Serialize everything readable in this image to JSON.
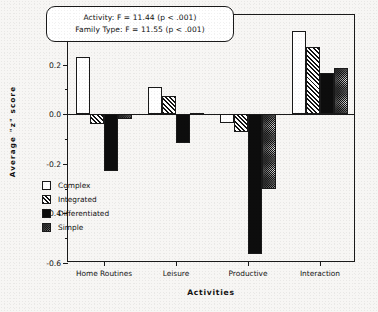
{
  "chart_data": {
    "type": "bar",
    "title": "",
    "xlabel": "Activities",
    "ylabel": "Average \"z\" score",
    "categories": [
      "Home Routines",
      "Leisure",
      "Productive",
      "Interaction"
    ],
    "series": [
      {
        "name": "Complex",
        "pattern": "open-white",
        "values": [
          0.23,
          0.11,
          -0.035,
          0.335
        ]
      },
      {
        "name": "Integrated",
        "pattern": "diagonal-hatch",
        "values": [
          -0.04,
          0.075,
          -0.07,
          0.27
        ]
      },
      {
        "name": "Differentiated",
        "pattern": "solid-black",
        "values": [
          -0.23,
          -0.115,
          -0.565,
          0.165
        ]
      },
      {
        "name": "Simple",
        "pattern": "stipple-dots",
        "values": [
          -0.02,
          0.005,
          -0.3,
          0.185
        ]
      }
    ],
    "ylim": [
      -0.6,
      0.4
    ],
    "ytick_labels": [
      "0.4",
      "0.2",
      "0.0",
      "-0.2",
      "-0.4",
      "-0.6"
    ],
    "ytick_values": [
      0.4,
      0.2,
      0.0,
      -0.2,
      -0.4,
      -0.6
    ],
    "yminor_values": [
      0.3,
      0.1,
      -0.1,
      -0.3,
      -0.5
    ],
    "grid": false,
    "legend_position": "inside-lower-left",
    "annotations": [
      "Activity: F = 11.44 (p < .001)",
      "Family Type: F = 11.55 (p < .001)"
    ]
  },
  "legend": {
    "items": [
      {
        "label": "Complex"
      },
      {
        "label": "Integrated"
      },
      {
        "label": "Differentiated"
      },
      {
        "label": "Simple"
      }
    ]
  },
  "colors": {
    "ink": "#1a1a1a",
    "paper": "#f7f6f4",
    "bar_fill_light": "#ffffff",
    "bar_fill_dark": "#0d0d0d"
  }
}
